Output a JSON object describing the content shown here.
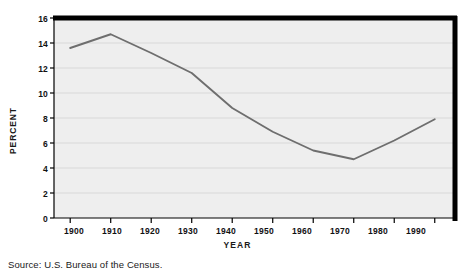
{
  "chart_data": {
    "type": "line",
    "title": "",
    "xlabel": "YEAR",
    "ylabel": "PERCENT",
    "x": [
      1900,
      1910,
      1920,
      1930,
      1940,
      1950,
      1960,
      1970,
      1980,
      1990
    ],
    "categories": [
      "1900",
      "1910",
      "1920",
      "1930",
      "1940",
      "1950",
      "1960",
      "1970",
      "1980",
      "1990"
    ],
    "values": [
      13.6,
      14.7,
      13.2,
      11.6,
      8.8,
      6.9,
      5.4,
      4.7,
      6.2,
      7.9
    ],
    "series": [
      {
        "name": "Percent",
        "values": [
          13.6,
          14.7,
          13.2,
          11.6,
          8.8,
          6.9,
          5.4,
          4.7,
          6.2,
          7.9
        ]
      }
    ],
    "xlim": [
      1896,
      1995
    ],
    "ylim": [
      0,
      16
    ],
    "yticks": [
      0,
      2,
      4,
      6,
      8,
      10,
      12,
      14,
      16
    ],
    "ytick_labels": [
      "0",
      "2",
      "4",
      "6",
      "8",
      "10",
      "12",
      "14",
      "16"
    ],
    "xticks": [
      1900,
      1910,
      1920,
      1930,
      1940,
      1950,
      1960,
      1970,
      1980,
      1990
    ],
    "grid": "horizontal",
    "legend": "none",
    "line_color": "#6e6e6e",
    "plot_background": "#eeeeee",
    "frame_color": "#000000"
  },
  "source": {
    "note": "Source: U.S. Bureau of the Census."
  }
}
